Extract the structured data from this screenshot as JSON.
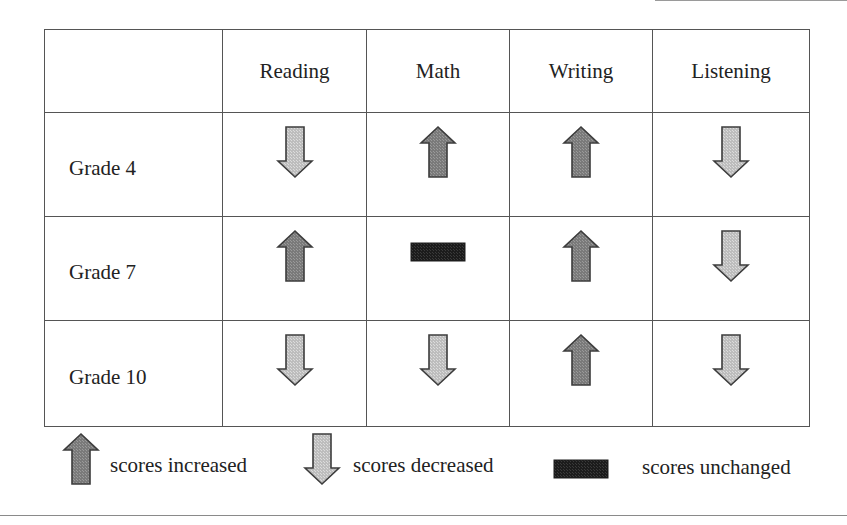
{
  "figure": {
    "header": {
      "corner": "",
      "columns": [
        "Reading",
        "Math",
        "Writing",
        "Listening"
      ]
    },
    "rows": [
      {
        "label": "Grade 4",
        "values": [
          "decreased",
          "increased",
          "increased",
          "decreased"
        ]
      },
      {
        "label": "Grade 7",
        "values": [
          "increased",
          "unchanged",
          "increased",
          "decreased"
        ]
      },
      {
        "label": "Grade 10",
        "values": [
          "decreased",
          "decreased",
          "increased",
          "decreased"
        ]
      }
    ],
    "legend": [
      {
        "status": "increased",
        "icon": "arrow-up-icon",
        "label": "scores increased"
      },
      {
        "status": "decreased",
        "icon": "arrow-down-icon",
        "label": "scores decreased"
      },
      {
        "status": "unchanged",
        "icon": "bar-icon",
        "label": "scores unchanged"
      }
    ],
    "colors": {
      "increased_fill": "#7a7a7a",
      "decreased_fill": "#bdbdbd",
      "unchanged_fill": "#1c1c1c",
      "stroke": "#3c3c3c",
      "grid": "#555555"
    }
  }
}
